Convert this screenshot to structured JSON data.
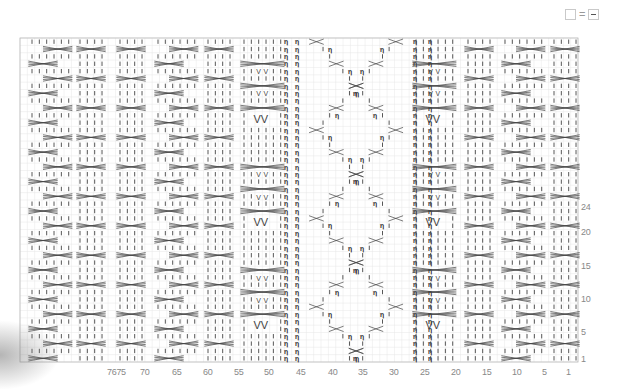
{
  "legend": {
    "left_symbol": "empty-box",
    "equals": "=",
    "right_symbol": "purl-dash-box"
  },
  "chart_data": {
    "type": "knitting-chart",
    "stitches": 76,
    "rows": 44,
    "grid": {
      "left": 20,
      "top": 38,
      "right": 578,
      "bottom": 362
    },
    "x_tick_labels": [
      {
        "label": "7675",
        "x": 113
      },
      {
        "label": "70",
        "x": 146
      },
      {
        "label": "65",
        "x": 178
      },
      {
        "label": "60",
        "x": 209
      },
      {
        "label": "55",
        "x": 240
      },
      {
        "label": "50",
        "x": 270
      },
      {
        "label": "45",
        "x": 302
      },
      {
        "label": "40",
        "x": 334
      },
      {
        "label": "35",
        "x": 364
      },
      {
        "label": "30",
        "x": 395
      },
      {
        "label": "25",
        "x": 426
      },
      {
        "label": "20",
        "x": 457
      },
      {
        "label": "15",
        "x": 488
      },
      {
        "label": "10",
        "x": 518
      },
      {
        "label": "5",
        "x": 548
      },
      {
        "label": "1",
        "x": 572
      }
    ],
    "y_tick_labels": [
      {
        "label": "24",
        "y": 208
      },
      {
        "label": "20",
        "y": 233
      },
      {
        "label": "15",
        "y": 267
      },
      {
        "label": "10",
        "y": 300
      },
      {
        "label": "5",
        "y": 333
      },
      {
        "label": "1",
        "y": 360
      }
    ],
    "panels": [
      {
        "type": "cable-zigzag",
        "x0": 32,
        "w": 6
      },
      {
        "type": "cable-simple",
        "x0": 80,
        "w": 4
      },
      {
        "type": "cable-simple",
        "x0": 120,
        "w": 4
      },
      {
        "type": "cable-zigzag",
        "x0": 158,
        "w": 6
      },
      {
        "type": "cable-simple",
        "x0": 208,
        "w": 4
      },
      {
        "type": "cable-vv",
        "x0": 244,
        "w": 6
      },
      {
        "type": "twisted-diamond",
        "x0": 290,
        "w": 16
      },
      {
        "type": "cable-vv",
        "x0": 416,
        "w": 6
      },
      {
        "type": "cable-simple",
        "x0": 468,
        "w": 4
      },
      {
        "type": "cable-zigzag",
        "x0": 505,
        "w": 6
      },
      {
        "type": "cable-simple",
        "x0": 554,
        "w": 4
      }
    ],
    "legend_meaning": "empty box = purl (dash)"
  }
}
